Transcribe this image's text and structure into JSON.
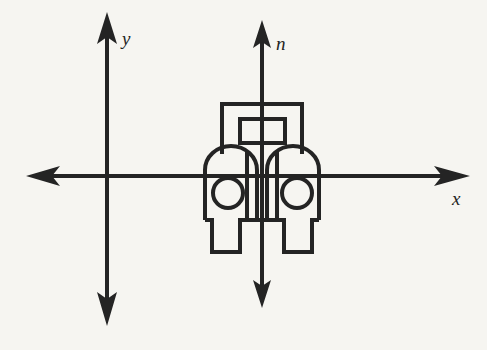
{
  "figure": {
    "background_color": "#f6f5f1",
    "stroke_color": "#242424",
    "axes": [
      {
        "id": "y-axis",
        "label": "y",
        "orientation": "vertical",
        "label_position": {
          "x": 122,
          "y": 45
        },
        "line": {
          "x1": 107,
          "y1": 18,
          "x2": 107,
          "y2": 320
        },
        "arrowheads": [
          "up",
          "down"
        ]
      },
      {
        "id": "x-axis",
        "label": "x",
        "orientation": "horizontal",
        "label_position": {
          "x": 455,
          "y": 203
        },
        "line": {
          "x1": 30,
          "y1": 176,
          "x2": 466,
          "y2": 176
        },
        "arrowheads": [
          "left",
          "right"
        ]
      },
      {
        "id": "n-axis",
        "label": "n",
        "orientation": "vertical",
        "label_position": {
          "x": 276,
          "y": 50
        },
        "line": {
          "x1": 262,
          "y1": 22,
          "x2": 262,
          "y2": 302
        },
        "arrowheads": [
          "up",
          "down"
        ]
      }
    ],
    "object": {
      "name": "vehicle-front-view",
      "description": "Symmetric front elevation of a car or tractor, centered on the n-axis",
      "center_x": 262,
      "parts": [
        {
          "name": "cab-body",
          "shape": "rectangle",
          "x": 222,
          "y": 104,
          "width": 80,
          "height": 50
        },
        {
          "name": "windshield",
          "shape": "rectangle",
          "x": 240,
          "y": 119,
          "width": 45,
          "height": 24
        },
        {
          "name": "left-fender",
          "shape": "rounded-top-rectangle",
          "x": 205,
          "y": 152,
          "width": 52,
          "height": 68
        },
        {
          "name": "right-fender",
          "shape": "rounded-top-rectangle",
          "x": 267,
          "y": 152,
          "width": 52,
          "height": 68
        },
        {
          "name": "left-headlight",
          "shape": "circle",
          "cx": 228,
          "cy": 193,
          "r": 15
        },
        {
          "name": "right-headlight",
          "shape": "circle",
          "cx": 297,
          "cy": 193,
          "r": 15
        },
        {
          "name": "left-tire",
          "shape": "rectangle",
          "x": 212,
          "y": 220,
          "width": 28,
          "height": 32
        },
        {
          "name": "right-tire",
          "shape": "rectangle",
          "x": 284,
          "y": 220,
          "width": 28,
          "height": 32
        },
        {
          "name": "grille-center-panel",
          "shape": "rectangle",
          "x": 247,
          "y": 152,
          "width": 30,
          "height": 68
        }
      ]
    }
  }
}
